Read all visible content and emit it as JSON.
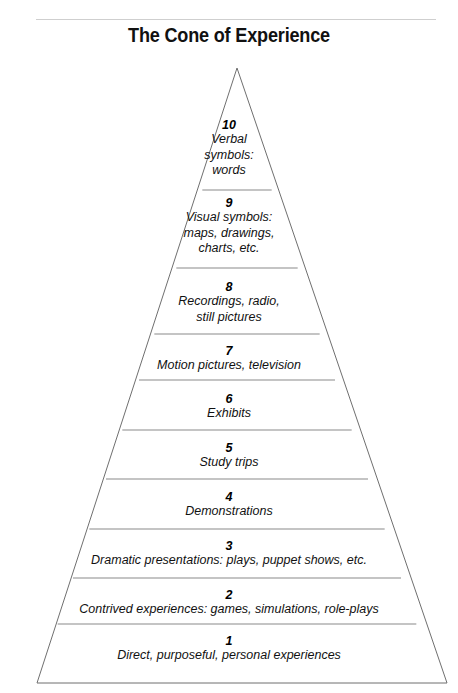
{
  "header": {
    "title": "The Cone of Experience",
    "rule": "horizontal-rule"
  },
  "diagram": {
    "name": "cone-of-experience-pyramid",
    "shape": "triangle",
    "apex": {
      "x": 237,
      "y": 68
    },
    "base_left": {
      "x": 37,
      "y": 683
    },
    "base_right": {
      "x": 447,
      "y": 683
    },
    "outline_color": "#6f6f6f",
    "divider_color": "#8a8a8a",
    "fill_color": "#ffffff"
  },
  "levels": [
    {
      "number": "10",
      "label": "Verbal\nsymbols:\nwords",
      "top": 190,
      "text_top": 118
    },
    {
      "number": "9",
      "label": "Visual symbols:\nmaps, drawings,\ncharts, etc.",
      "top": 268,
      "text_top": 196
    },
    {
      "number": "8",
      "label": "Recordings, radio,\nstill pictures",
      "top": 334,
      "text_top": 280
    },
    {
      "number": "7",
      "label": "Motion pictures, television",
      "top": 380,
      "text_top": 344
    },
    {
      "number": "6",
      "label": "Exhibits",
      "top": 430,
      "text_top": 392
    },
    {
      "number": "5",
      "label": "Study trips",
      "top": 479,
      "text_top": 441
    },
    {
      "number": "4",
      "label": "Demonstrations",
      "top": 529,
      "text_top": 490
    },
    {
      "number": "3",
      "label": "Dramatic presentations: plays, puppet shows, etc.",
      "top": 578,
      "text_top": 539
    },
    {
      "number": "2",
      "label": "Contrived experiences: games, simulations, role-plays",
      "top": 624,
      "text_top": 588
    },
    {
      "number": "1",
      "label": "Direct, purposeful, personal experiences",
      "top": 683,
      "text_top": 634
    }
  ],
  "chart_data": {
    "type": "diagram",
    "title": "The Cone of Experience",
    "categories": [
      "1",
      "2",
      "3",
      "4",
      "5",
      "6",
      "7",
      "8",
      "9",
      "10"
    ],
    "values": [
      "Direct, purposeful, personal experiences",
      "Contrived experiences: games, simulations, role-plays",
      "Dramatic presentations: plays, puppet shows, etc.",
      "Demonstrations",
      "Study trips",
      "Exhibits",
      "Motion pictures, television",
      "Recordings, radio, still pictures",
      "Visual symbols: maps, drawings, charts, etc.",
      "Verbal symbols: words"
    ],
    "xlabel": "",
    "ylabel": "",
    "legend": [],
    "grid": false
  }
}
